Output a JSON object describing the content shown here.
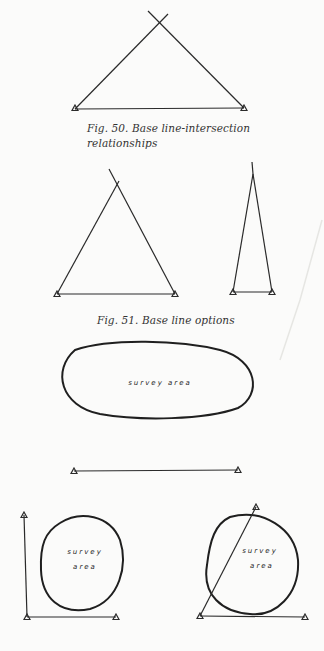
{
  "figure_50": {
    "caption_line1": "Fig. 50. Base line-intersection",
    "caption_line2": "relationships"
  },
  "figure_51": {
    "caption": "Fig. 51. Base line options"
  },
  "survey_labels": {
    "ellipse": "survey area",
    "circle_left_line1": "survey",
    "circle_left_line2": "area",
    "circle_right_line1": "survey",
    "circle_right_line2": "area"
  },
  "colors": {
    "ink": "#2a2a2a",
    "paper": "#fbfbfa",
    "caption": "#333333"
  }
}
